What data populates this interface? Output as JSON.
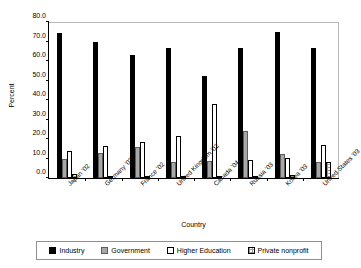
{
  "chart_data": {
    "type": "bar",
    "title": "",
    "xlabel": "Country",
    "ylabel": "Percent",
    "ylim": [
      0,
      80
    ],
    "ytick_step": 10,
    "yticks": [
      "0.0",
      "10.0",
      "20.0",
      "30.0",
      "40.0",
      "50.0",
      "60.0",
      "70.0",
      "80.0"
    ],
    "grid": false,
    "legend_position": "bottom",
    "categories": [
      "Japan '02",
      "Germany '03",
      "France '02",
      "United Kingdom '02",
      "Canada '04",
      "Russia '03",
      "Korea '03",
      "United States '03"
    ],
    "series": [
      {
        "name": "Industry",
        "color": "#000000",
        "values": [
          74.0,
          69.3,
          62.6,
          66.0,
          52.0,
          66.0,
          74.4,
          66.0
        ]
      },
      {
        "name": "Government",
        "color": "#a8a8a8",
        "values": [
          9.5,
          13.0,
          16.0,
          8.3,
          8.8,
          24.0,
          12.0,
          8.0
        ]
      },
      {
        "name": "Higher Education",
        "color": "#ffffff",
        "values": [
          14.0,
          16.3,
          18.2,
          21.5,
          37.5,
          9.0,
          10.3,
          16.8
        ]
      },
      {
        "name": "Private nonprofit",
        "color": "#e8e8e8",
        "values": [
          2.2,
          0.3,
          0.8,
          0.5,
          0.8,
          0.5,
          1.5,
          8.0
        ]
      }
    ]
  },
  "axes": {
    "y_title": "Percent",
    "x_title": "Country"
  },
  "legend": {
    "items": [
      {
        "label": "Industry",
        "swatch": "industry"
      },
      {
        "label": "Government",
        "swatch": "government"
      },
      {
        "label": "Higher Education",
        "swatch": "higher"
      },
      {
        "label": "Private nonprofit",
        "swatch": "nonprofit"
      }
    ]
  }
}
